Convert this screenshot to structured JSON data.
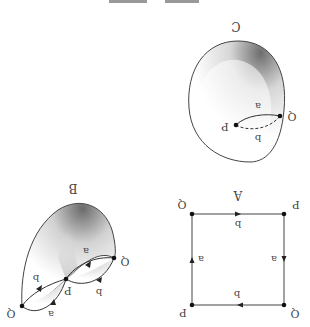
{
  "figure": {
    "orientation": "rotated 180 degrees",
    "caption_text": "",
    "colors": {
      "line": "#333333",
      "label": "#444444",
      "shade_dark": "#777777",
      "shade_light": "#ffffff"
    }
  },
  "panels": {
    "A": {
      "title": "A",
      "description": "square with identified edges",
      "vertices": [
        {
          "label": "Q",
          "position": "top-left"
        },
        {
          "label": "P",
          "position": "top-right"
        },
        {
          "label": "P",
          "position": "bottom-left"
        },
        {
          "label": "Q",
          "position": "bottom-right"
        }
      ],
      "edges": [
        {
          "label": "b",
          "side": "top"
        },
        {
          "label": "a",
          "side": "right"
        },
        {
          "label": "b",
          "side": "bottom"
        },
        {
          "label": "a",
          "side": "left"
        }
      ]
    },
    "B": {
      "title": "B",
      "description": "partially glued surface",
      "points": [
        {
          "label": "Q",
          "position": "left"
        },
        {
          "label": "P",
          "position": "middle"
        },
        {
          "label": "Q",
          "position": "right"
        }
      ],
      "edges": [
        {
          "label": "b",
          "position": "upper-left"
        },
        {
          "label": "a",
          "position": "lower-left"
        },
        {
          "label": "a",
          "position": "upper-right"
        },
        {
          "label": "b",
          "position": "lower-right"
        }
      ]
    },
    "C": {
      "title": "C",
      "description": "closed surface (sphere)",
      "points": [
        {
          "label": "P",
          "position": "inner"
        },
        {
          "label": "Q",
          "position": "edge"
        }
      ],
      "edges": [
        {
          "label": "a",
          "style": "solid"
        },
        {
          "label": "b",
          "style": "dashed"
        }
      ]
    }
  }
}
